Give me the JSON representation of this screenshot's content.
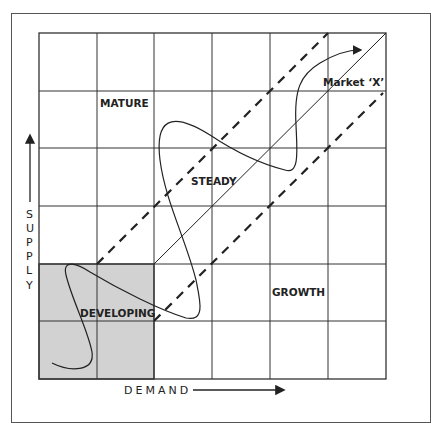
{
  "diagram": {
    "type": "market-evolution-matrix",
    "grid": {
      "rows": 6,
      "cols": 6
    },
    "quadrants": {
      "developing": "DEVELOPING",
      "mature": "MATURE",
      "steady": "STEADY",
      "growth": "GROWTH"
    },
    "market_label": "Market ‘X’",
    "axes": {
      "x_label": "DEMAND",
      "y_letters": [
        "S",
        "U",
        "P",
        "P",
        "L",
        "Y"
      ]
    },
    "colors": {
      "shaded": "#d2d2d2",
      "lines": "#222222"
    }
  }
}
